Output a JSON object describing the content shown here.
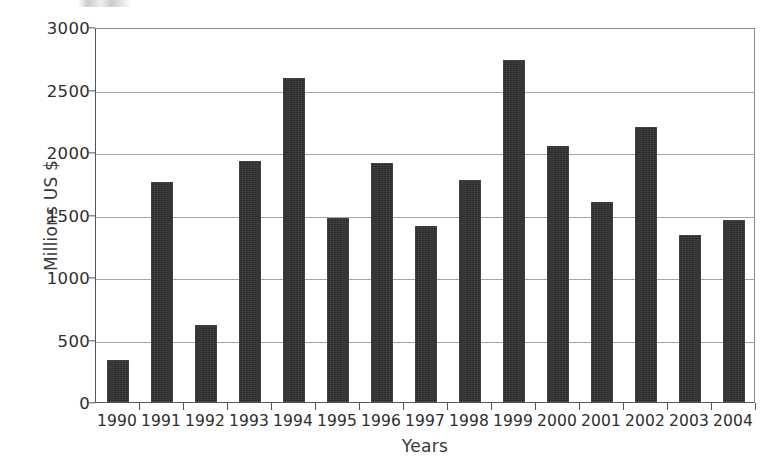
{
  "chart_data": {
    "type": "bar",
    "title": "",
    "xlabel": "Years",
    "ylabel": "Millions US $",
    "categories": [
      "1990",
      "1991",
      "1992",
      "1993",
      "1994",
      "1995",
      "1996",
      "1997",
      "1998",
      "1999",
      "2000",
      "2001",
      "2002",
      "2003",
      "2004"
    ],
    "values": [
      340,
      1760,
      615,
      1925,
      2590,
      1475,
      1915,
      1410,
      1775,
      2740,
      2050,
      1600,
      2200,
      1340,
      1455
    ],
    "ylim": [
      0,
      3000
    ],
    "yticks": [
      0,
      500,
      1000,
      1500,
      2000,
      2500,
      3000
    ],
    "ytick_labels": [
      "0",
      "500",
      "1000",
      "1500",
      "2000",
      "2500",
      "3000"
    ],
    "grid": true,
    "legend": false,
    "legend_position": "none",
    "series": [
      {
        "name": "Millions US $",
        "color": "#2d2d2d",
        "values": [
          340,
          1760,
          615,
          1925,
          2590,
          1475,
          1915,
          1410,
          1775,
          2740,
          2050,
          1600,
          2200,
          1340,
          1455
        ]
      }
    ],
    "colors": {
      "bar": "#2d2d2d",
      "gridline": "#a5a5a5",
      "axis": "#555555",
      "text": "#2e2e2e",
      "background": "#ffffff"
    }
  }
}
